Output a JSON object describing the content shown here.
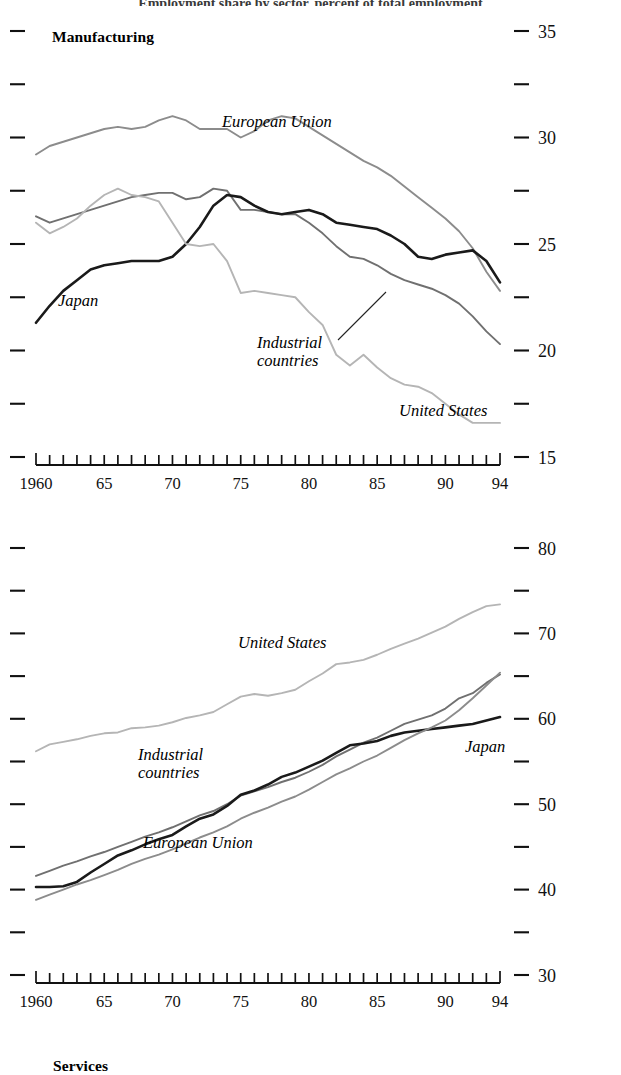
{
  "figure": {
    "clipped_title": "Employment share by sector, percent of total employment"
  },
  "panels": [
    {
      "id": "manufacturing",
      "title": "Manufacturing",
      "y_ticks_major": [
        15,
        20,
        25,
        30,
        35
      ],
      "y_ticks_minor": [
        17.5,
        22.5,
        27.5,
        32.5
      ],
      "ylim": [
        15,
        35
      ],
      "x_labels": [
        "1960",
        "65",
        "70",
        "75",
        "80",
        "85",
        "90",
        "94"
      ],
      "x_label_years": [
        1960,
        1965,
        1970,
        1975,
        1980,
        1985,
        1990,
        1994
      ],
      "xlim": [
        1960,
        1994
      ],
      "series_labels": [
        {
          "name": "European Union",
          "x": 222,
          "y": 127
        },
        {
          "name": "Japan",
          "x": 58,
          "y": 306
        },
        {
          "name": "Industrial countries",
          "x": 257,
          "y": 348,
          "two_line": true
        },
        {
          "name": "United States",
          "x": 399,
          "y": 416
        }
      ]
    },
    {
      "id": "services",
      "title": "Services",
      "y_ticks_major": [
        30,
        40,
        50,
        60,
        70,
        80
      ],
      "y_ticks_minor": [
        35,
        45,
        55,
        65,
        75
      ],
      "ylim": [
        30,
        80
      ],
      "x_labels": [
        "1960",
        "65",
        "70",
        "75",
        "80",
        "85",
        "90",
        "94"
      ],
      "x_label_years": [
        1960,
        1965,
        1970,
        1975,
        1980,
        1985,
        1990,
        1994
      ],
      "xlim": [
        1960,
        1994
      ],
      "series_labels": [
        {
          "name": "United States",
          "x": 238,
          "y": 648
        },
        {
          "name": "Industrial countries",
          "x": 138,
          "y": 760,
          "two_line": true
        },
        {
          "name": "Japan",
          "x": 465,
          "y": 752
        },
        {
          "name": "European Union",
          "x": 143,
          "y": 848
        }
      ]
    }
  ],
  "colors": {
    "japan": "#1a1a1a",
    "industrial_countries": "#707070",
    "european_union": "#8c8c8c",
    "united_states": "#b5b5b5",
    "axis": "#111111",
    "text": "#000000"
  },
  "chart_data": [
    {
      "type": "line",
      "title": "Manufacturing",
      "xlabel": "",
      "ylabel": "",
      "xlim": [
        1960,
        1994
      ],
      "ylim": [
        15,
        35
      ],
      "grid": false,
      "legend": "inline-annotations",
      "x": [
        1960,
        1961,
        1962,
        1963,
        1964,
        1965,
        1966,
        1967,
        1968,
        1969,
        1970,
        1971,
        1972,
        1973,
        1974,
        1975,
        1976,
        1977,
        1978,
        1979,
        1980,
        1981,
        1982,
        1983,
        1984,
        1985,
        1986,
        1987,
        1988,
        1989,
        1990,
        1991,
        1992,
        1993,
        1994
      ],
      "series": [
        {
          "name": "European Union",
          "color": "#8c8c8c",
          "values": [
            29.2,
            29.6,
            29.8,
            30.0,
            30.2,
            30.4,
            30.5,
            30.4,
            30.5,
            30.8,
            31.0,
            30.8,
            30.4,
            30.4,
            30.4,
            30.0,
            30.3,
            30.8,
            31.0,
            30.9,
            30.5,
            30.1,
            29.7,
            29.3,
            28.9,
            28.6,
            28.2,
            27.7,
            27.2,
            26.7,
            26.2,
            25.6,
            24.8,
            23.7,
            22.8
          ]
        },
        {
          "name": "Industrial countries",
          "color": "#707070",
          "values": [
            26.3,
            26.0,
            26.2,
            26.4,
            26.6,
            26.8,
            27.0,
            27.2,
            27.3,
            27.4,
            27.4,
            27.1,
            27.2,
            27.6,
            27.5,
            26.6,
            26.6,
            26.5,
            26.4,
            26.4,
            26.0,
            25.5,
            24.9,
            24.4,
            24.3,
            24.0,
            23.6,
            23.3,
            23.1,
            22.9,
            22.6,
            22.2,
            21.6,
            20.9,
            20.3
          ]
        },
        {
          "name": "Japan",
          "color": "#1a1a1a",
          "values": [
            21.3,
            22.1,
            22.8,
            23.3,
            23.8,
            24.0,
            24.1,
            24.2,
            24.2,
            24.2,
            24.4,
            25.0,
            25.8,
            26.8,
            27.3,
            27.2,
            26.8,
            26.5,
            26.4,
            26.5,
            26.6,
            26.4,
            26.0,
            25.9,
            25.8,
            25.7,
            25.4,
            25.0,
            24.4,
            24.3,
            24.5,
            24.6,
            24.7,
            24.2,
            23.2
          ]
        },
        {
          "name": "United States",
          "color": "#b5b5b5",
          "values": [
            26.0,
            25.5,
            25.8,
            26.2,
            26.8,
            27.3,
            27.6,
            27.3,
            27.2,
            27.0,
            26.0,
            25.0,
            24.9,
            25.0,
            24.2,
            22.7,
            22.8,
            22.7,
            22.6,
            22.5,
            21.8,
            21.2,
            19.8,
            19.3,
            19.8,
            19.2,
            18.7,
            18.4,
            18.3,
            18.0,
            17.5,
            17.0,
            16.6,
            16.6,
            16.6
          ]
        }
      ]
    },
    {
      "type": "line",
      "title": "Services",
      "xlabel": "",
      "ylabel": "",
      "xlim": [
        1960,
        1994
      ],
      "ylim": [
        30,
        80
      ],
      "grid": false,
      "legend": "inline-annotations",
      "x": [
        1960,
        1961,
        1962,
        1963,
        1964,
        1965,
        1966,
        1967,
        1968,
        1969,
        1970,
        1971,
        1972,
        1973,
        1974,
        1975,
        1976,
        1977,
        1978,
        1979,
        1980,
        1981,
        1982,
        1983,
        1984,
        1985,
        1986,
        1987,
        1988,
        1989,
        1990,
        1991,
        1992,
        1993,
        1994
      ],
      "series": [
        {
          "name": "United States",
          "color": "#b5b5b5",
          "values": [
            56.2,
            57.0,
            57.3,
            57.6,
            58.0,
            58.3,
            58.4,
            58.9,
            59.0,
            59.2,
            59.6,
            60.1,
            60.4,
            60.8,
            61.7,
            62.6,
            62.9,
            62.7,
            63.0,
            63.4,
            64.4,
            65.3,
            66.4,
            66.6,
            66.9,
            67.5,
            68.2,
            68.8,
            69.4,
            70.1,
            70.8,
            71.7,
            72.5,
            73.2,
            73.4
          ]
        },
        {
          "name": "Industrial countries",
          "color": "#707070",
          "values": [
            41.6,
            42.2,
            42.8,
            43.3,
            43.9,
            44.4,
            45.0,
            45.6,
            46.2,
            46.7,
            47.3,
            48.0,
            48.7,
            49.2,
            50.0,
            51.0,
            51.5,
            52.0,
            52.6,
            53.1,
            53.8,
            54.6,
            55.6,
            56.4,
            57.2,
            57.8,
            58.6,
            59.4,
            59.9,
            60.4,
            61.2,
            62.4,
            63.0,
            64.2,
            65.2
          ]
        },
        {
          "name": "Japan",
          "color": "#1a1a1a",
          "values": [
            40.3,
            40.3,
            40.4,
            40.9,
            42.0,
            43.0,
            44.0,
            44.6,
            45.3,
            45.9,
            46.4,
            47.4,
            48.3,
            48.8,
            49.8,
            51.1,
            51.6,
            52.3,
            53.2,
            53.7,
            54.4,
            55.1,
            56.0,
            56.9,
            57.1,
            57.4,
            58.0,
            58.4,
            58.6,
            58.8,
            59.0,
            59.2,
            59.4,
            59.8,
            60.2
          ]
        },
        {
          "name": "European Union",
          "color": "#8c8c8c",
          "values": [
            38.8,
            39.4,
            40.0,
            40.6,
            41.1,
            41.7,
            42.3,
            43.0,
            43.6,
            44.1,
            44.7,
            45.4,
            46.1,
            46.7,
            47.4,
            48.3,
            49.0,
            49.6,
            50.3,
            50.9,
            51.7,
            52.6,
            53.5,
            54.2,
            55.0,
            55.7,
            56.6,
            57.5,
            58.3,
            59.0,
            59.8,
            61.0,
            62.4,
            63.9,
            65.4
          ]
        }
      ]
    }
  ]
}
